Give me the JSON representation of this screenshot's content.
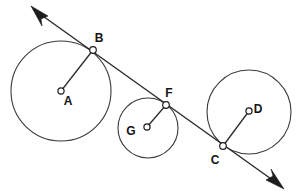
{
  "figure": {
    "width": 297,
    "height": 196,
    "background_color": "#ffffff",
    "stroke_color": "#2b2b2b",
    "circle_stroke_color": "#3a3a3a",
    "label_color": "#141414"
  },
  "labels": {
    "A": "A",
    "B": "B",
    "C": "C",
    "D": "D",
    "F": "F",
    "G": "G"
  },
  "circles": [
    {
      "name": "circle-a",
      "center_label": "A",
      "cx": 61,
      "cy": 91,
      "r": 50,
      "tangent_point_label": "B"
    },
    {
      "name": "circle-g",
      "center_label": "G",
      "cx": 148,
      "cy": 128,
      "r": 30,
      "tangent_point_label": "F"
    },
    {
      "name": "circle-d",
      "center_label": "D",
      "cx": 249,
      "cy": 112,
      "r": 42,
      "tangent_point_label": "C"
    }
  ],
  "centers": [
    {
      "name": "center-a",
      "label": "A",
      "x": 61,
      "y": 91,
      "label_x": 68,
      "label_y": 105
    },
    {
      "name": "center-g",
      "label": "G",
      "x": 147,
      "y": 127,
      "label_x": 131,
      "label_y": 135
    },
    {
      "name": "center-d",
      "label": "D",
      "x": 249,
      "y": 111,
      "label_x": 258,
      "label_y": 113
    }
  ],
  "tangent_points": [
    {
      "name": "point-b",
      "label": "B",
      "x": 93,
      "y": 50,
      "label_x": 99,
      "label_y": 42
    },
    {
      "name": "point-f",
      "label": "F",
      "x": 166,
      "y": 105,
      "label_x": 169,
      "label_y": 97
    },
    {
      "name": "point-c",
      "label": "C",
      "x": 223,
      "y": 146,
      "label_x": 215,
      "label_y": 164
    }
  ],
  "tangent_line": {
    "name": "tangent-line",
    "start_x": 33,
    "start_y": 9,
    "end_x": 281,
    "end_y": 186,
    "arrow_start": true,
    "arrow_end": true
  },
  "radii": [
    {
      "name": "radius-ab",
      "from_label": "A",
      "to_label": "B",
      "x1": 61,
      "y1": 91,
      "x2": 93,
      "y2": 50
    },
    {
      "name": "radius-gf",
      "from_label": "G",
      "to_label": "F",
      "x1": 147,
      "y1": 127,
      "x2": 166,
      "y2": 105
    },
    {
      "name": "radius-dc",
      "from_label": "D",
      "to_label": "C",
      "x1": 249,
      "y1": 111,
      "x2": 223,
      "y2": 146
    }
  ],
  "arrowheads": [
    {
      "name": "arrowhead-upper-left",
      "tip_x": 31,
      "tip_y": 6,
      "points": "31,6 48,16 41,19 42,26"
    },
    {
      "name": "arrowhead-lower-right",
      "tip_x": 284,
      "tip_y": 189,
      "points": "284,189 266,180 273,176 271,169"
    }
  ]
}
